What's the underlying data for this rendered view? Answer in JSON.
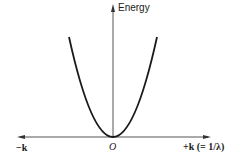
{
  "diagram": {
    "y_axis_label": "Energy",
    "x_axis_negative_label": "−k",
    "x_axis_positive_label": "+k (= 1/λ)",
    "origin_label": "O",
    "curve": "parabola",
    "colors": {
      "ink": "#1a1a1a",
      "axis": "#555555",
      "background": "#ffffff"
    }
  }
}
